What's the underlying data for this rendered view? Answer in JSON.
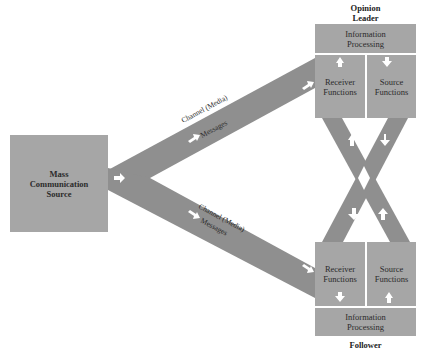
{
  "diagram": {
    "type": "two-step flow of communication",
    "colors": {
      "box_fill": "#a6a6a6",
      "band_fill": "#8f8f8f",
      "arrow_fill": "#ffffff",
      "text": "#2b2b2b",
      "background": "#ffffff"
    },
    "source": {
      "label": "Mass\nCommunication\nSource"
    },
    "opinion_leader": {
      "title": "Opinion\nLeader",
      "information_processing": "Information\nProcessing",
      "receiver_functions": "Receiver\nFunctions",
      "source_functions": "Source\nFunctions"
    },
    "follower": {
      "title": "Follower",
      "information_processing": "Information\nProcessing",
      "receiver_functions": "Receiver\nFunctions",
      "source_functions": "Source\nFunctions"
    },
    "upper_channel": {
      "channel_label": "Channel (Media)",
      "messages_label": "Messages"
    },
    "lower_channel": {
      "channel_label": "Channel (Media)",
      "messages_label": "Messages"
    }
  }
}
